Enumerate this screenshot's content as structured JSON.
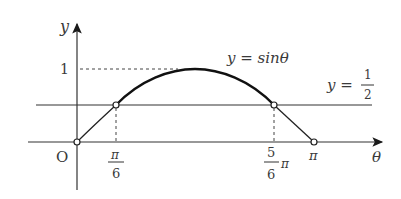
{
  "diagram": {
    "axes": {
      "x_label": "θ",
      "y_label": "y",
      "origin_label": "O"
    },
    "curve_label": "y = sinθ",
    "line_label": {
      "prefix": "y =",
      "numerator": "1",
      "denominator": "2"
    },
    "y_tick": "1",
    "x_ticks": {
      "pi_over_6": {
        "numerator": "π",
        "denominator": "6"
      },
      "five_pi_over_6": {
        "numerator": "5",
        "denominator": "6",
        "suffix": "π"
      },
      "pi": "π"
    },
    "colors": {
      "line": "#2a2a2a",
      "text": "#3a3a3a",
      "background": "#ffffff"
    }
  }
}
